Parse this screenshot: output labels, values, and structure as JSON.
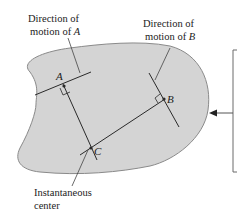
{
  "figure": {
    "labels": {
      "dir_a_line1": "Direction of",
      "dir_a_line2_prefix": "motion of ",
      "dir_a_point": "A",
      "dir_b_line1": "Direction of",
      "dir_b_line2_prefix": "motion of ",
      "dir_b_point": "B",
      "ic_line1": "Instantaneous",
      "ic_line2": "center"
    },
    "points": {
      "a": "A",
      "b": "B",
      "c": "C"
    },
    "colors": {
      "body_fill": "#d4d4d4",
      "body_stroke": "#8a8a8a",
      "line": "#2a2a2a",
      "bracket": "#6a6a6a"
    }
  }
}
